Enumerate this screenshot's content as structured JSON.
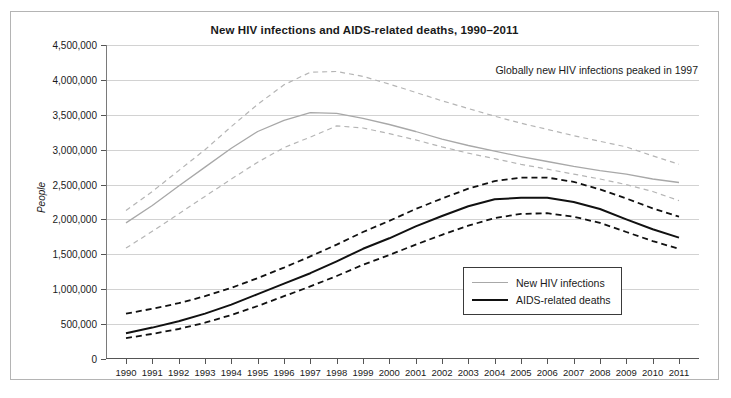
{
  "chart": {
    "title": "New HIV infections and AIDS-related deaths, 1990–2011",
    "annotation": "Globally new HIV infections peaked in 1997",
    "ylabel": "People"
  },
  "legend": {
    "items": [
      {
        "label": "New HIV infections",
        "style": "grey",
        "color": "#a8a8a8"
      },
      {
        "label": "AIDS-related deaths",
        "style": "black",
        "color": "#111111"
      }
    ]
  },
  "chart_data": {
    "type": "line",
    "title": "New HIV infections and AIDS-related deaths, 1990–2011",
    "annotations": [
      "Globally new HIV infections peaked in 1997"
    ],
    "xlabel": "",
    "ylabel": "People",
    "ylim": [
      0,
      4500000
    ],
    "ytick_step": 500000,
    "ytick_labels": [
      "0",
      "500,000",
      "1,000,000",
      "1,500,000",
      "2,000,000",
      "2,500,000",
      "3,000,000",
      "3,500,000",
      "4,000,000",
      "4,500,000"
    ],
    "grid": true,
    "legend_position": "bottom-right",
    "x": [
      1990,
      1991,
      1992,
      1993,
      1994,
      1995,
      1996,
      1997,
      1998,
      1999,
      2000,
      2001,
      2002,
      2003,
      2004,
      2005,
      2006,
      2007,
      2008,
      2009,
      2010,
      2011
    ],
    "series": [
      {
        "name": "New HIV infections",
        "style": "solid",
        "color": "#a8a8a8",
        "values": [
          1950000,
          2200000,
          2480000,
          2750000,
          3020000,
          3260000,
          3420000,
          3530000,
          3520000,
          3450000,
          3360000,
          3260000,
          3150000,
          3060000,
          2980000,
          2900000,
          2830000,
          2760000,
          2700000,
          2650000,
          2580000,
          2530000
        ]
      },
      {
        "name": "New HIV infections upper bound",
        "style": "dashed",
        "color": "#b5b5b5",
        "values": [
          2130000,
          2400000,
          2700000,
          3000000,
          3330000,
          3650000,
          3930000,
          4110000,
          4120000,
          4050000,
          3940000,
          3820000,
          3700000,
          3590000,
          3480000,
          3380000,
          3290000,
          3200000,
          3120000,
          3040000,
          2910000,
          2790000
        ]
      },
      {
        "name": "New HIV infections lower bound",
        "style": "dashed",
        "color": "#b5b5b5",
        "values": [
          1590000,
          1830000,
          2080000,
          2330000,
          2580000,
          2820000,
          3030000,
          3180000,
          3340000,
          3310000,
          3230000,
          3140000,
          3040000,
          2950000,
          2870000,
          2790000,
          2720000,
          2650000,
          2580000,
          2500000,
          2400000,
          2270000
        ]
      },
      {
        "name": "AIDS-related deaths",
        "style": "solid",
        "color": "#111111",
        "values": [
          370000,
          450000,
          540000,
          650000,
          780000,
          930000,
          1080000,
          1230000,
          1400000,
          1580000,
          1730000,
          1900000,
          2050000,
          2190000,
          2290000,
          2310000,
          2310000,
          2250000,
          2150000,
          2000000,
          1860000,
          1740000
        ]
      },
      {
        "name": "AIDS-related deaths upper bound",
        "style": "dashed",
        "color": "#111111",
        "values": [
          650000,
          720000,
          800000,
          900000,
          1020000,
          1160000,
          1310000,
          1470000,
          1640000,
          1820000,
          1980000,
          2150000,
          2300000,
          2440000,
          2550000,
          2600000,
          2600000,
          2540000,
          2430000,
          2300000,
          2160000,
          2040000
        ]
      },
      {
        "name": "AIDS-related deaths lower bound",
        "style": "dashed",
        "color": "#111111",
        "values": [
          300000,
          360000,
          430000,
          520000,
          630000,
          760000,
          900000,
          1040000,
          1190000,
          1350000,
          1490000,
          1640000,
          1780000,
          1910000,
          2020000,
          2080000,
          2090000,
          2040000,
          1950000,
          1820000,
          1690000,
          1580000
        ]
      }
    ]
  }
}
